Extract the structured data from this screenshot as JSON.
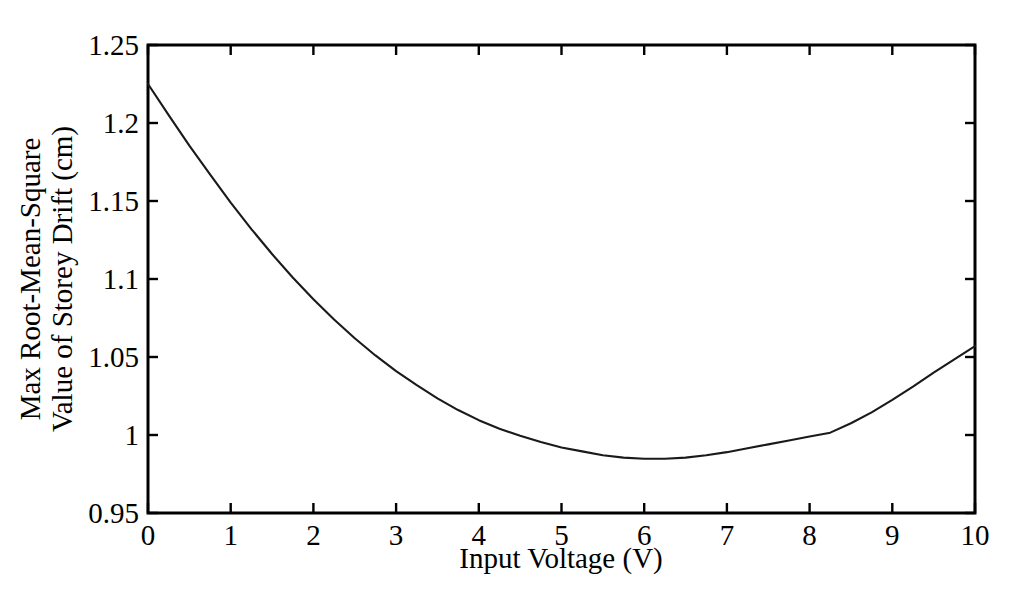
{
  "chart_data": {
    "type": "line",
    "title": "",
    "subtitle": "",
    "xlabel": "Input Voltage (V)",
    "ylabel": "Max Root-Mean-Square Value of Storey Drift (cm)",
    "ylabel_lines": [
      "Max Root-Mean-Square",
      "Value of Storey Drift (cm)"
    ],
    "xlim": [
      0,
      10
    ],
    "ylim": [
      0.95,
      1.25
    ],
    "xticks": [
      0,
      1,
      2,
      3,
      4,
      5,
      6,
      7,
      8,
      9,
      10
    ],
    "xticklabels": [
      "0",
      "1",
      "2",
      "3",
      "4",
      "5",
      "6",
      "7",
      "8",
      "9",
      "10"
    ],
    "yticks": [
      0.95,
      1.0,
      1.05,
      1.1,
      1.15,
      1.2,
      1.25
    ],
    "yticklabels": [
      "0.95",
      "1",
      "1.05",
      "1.1",
      "1.15",
      "1.2",
      "1.25"
    ],
    "grid": false,
    "legend": null,
    "series": [
      {
        "name": "Max RMS Storey Drift",
        "color": "#1a1a1a",
        "x": [
          0.0,
          0.25,
          0.5,
          0.75,
          1.0,
          1.25,
          1.5,
          1.75,
          2.0,
          2.25,
          2.5,
          2.75,
          3.0,
          3.25,
          3.5,
          3.75,
          4.0,
          4.25,
          4.5,
          4.75,
          5.0,
          5.25,
          5.5,
          5.75,
          6.0,
          6.25,
          6.5,
          6.75,
          7.0,
          7.25,
          7.5,
          7.75,
          8.0,
          8.25,
          8.5,
          8.75,
          9.0,
          9.25,
          9.5,
          9.75,
          10.0
        ],
        "y": [
          1.225,
          1.205,
          1.1855,
          1.167,
          1.149,
          1.132,
          1.116,
          1.101,
          1.087,
          1.074,
          1.062,
          1.051,
          1.041,
          1.032,
          1.0235,
          1.016,
          1.0095,
          1.004,
          0.9995,
          0.9955,
          0.992,
          0.9895,
          0.987,
          0.9855,
          0.9848,
          0.9848,
          0.9855,
          0.987,
          0.989,
          0.9915,
          0.994,
          0.9965,
          0.999,
          1.0015,
          1.0075,
          1.0145,
          1.0225,
          1.031,
          1.04,
          1.0485,
          1.057
        ]
      }
    ]
  },
  "axes": {
    "x_tick_count": 11,
    "y_tick_count": 7
  }
}
